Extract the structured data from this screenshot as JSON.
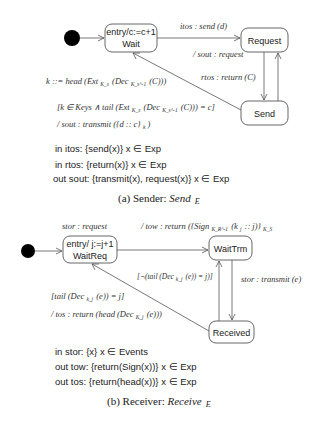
{
  "sender": {
    "states": {
      "wait": {
        "entry": "entry/c:=c+1",
        "name": "Wait"
      },
      "request": {
        "name": "Request"
      },
      "send": {
        "name": "Send"
      }
    },
    "transitions": {
      "wait_to_request": "itos : send (d)",
      "request_to_send_action": "/ sout : request",
      "send_to_request": "rtos : return (C)",
      "send_to_wait_assign": "k ::= head (Ext",
      "send_to_wait_assign_sub1": "K_s",
      "send_to_wait_assign_mid": "(Dec",
      "send_to_wait_assign_sub2": "K_s^-1",
      "send_to_wait_assign_end": "(C)))",
      "send_to_wait_guard_start": "[k ∈ Keys ∧ tail (Ext",
      "send_to_wait_guard_sub1": "K_s",
      "send_to_wait_guard_mid": "(Dec",
      "send_to_wait_guard_sub2": "K_s^-1",
      "send_to_wait_guard_end": "(C))) = c]",
      "send_to_wait_action_start": "/ sout : transmit ({d :: c}",
      "send_to_wait_action_sub": "k",
      "send_to_wait_action_end": ")"
    },
    "declarations": [
      "in itos: {send(x)} x ∈ Exp",
      "in rtos: {return(x)} x ∈ Exp",
      "out sout: {transmit(x), request(x)}  x ∈ Exp"
    ],
    "caption_prefix": "(a) Sender: ",
    "caption_name": "Send",
    "caption_sub": "E"
  },
  "receiver": {
    "states": {
      "waitreq": {
        "entry": "entry/ j:=j+1",
        "name": "WaitReq"
      },
      "waittrm": {
        "name": "WaitTrm"
      },
      "received": {
        "name": "Received"
      }
    },
    "transitions": {
      "waitreq_trigger": "stor : request",
      "waitreq_to_waittrm_start": "/ tow : return ({Sign",
      "waitreq_to_waittrm_sub1": "K_R^-1",
      "waitreq_to_waittrm_mid": "(k",
      "waitreq_to_waittrm_sub2": "j",
      "waitreq_to_waittrm_mid2": ":: j)}",
      "waitreq_to_waittrm_sub3": "K_S",
      "waittrm_to_received": "stor : transmit (e)",
      "received_to_waittrm_guard_start": "[¬(tail (Dec",
      "received_to_waittrm_guard_sub": "k_j",
      "received_to_waittrm_guard_end": "(e)) = j)]",
      "received_to_waitreq_guard_start": "[tail (Dec",
      "received_to_waitreq_guard_sub": "k_j",
      "received_to_waitreq_guard_end": "(e)) = j]",
      "received_to_waitreq_action_start": "/ tos : return (head (Dec",
      "received_to_waitreq_action_sub": "K_j",
      "received_to_waitreq_action_end": "(e)))"
    },
    "declarations": [
      "in stor: {x} x ∈ Events",
      "out tow: {return(Sign(x))}  x ∈ Exp",
      "out tos: {return(head(x))}  x ∈ Exp"
    ],
    "caption_prefix": "(b) Receiver: ",
    "caption_name": "Receive",
    "caption_sub": "E"
  }
}
